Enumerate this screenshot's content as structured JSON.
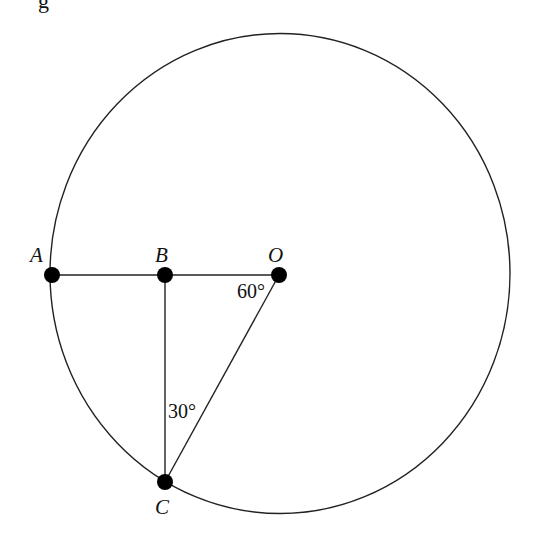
{
  "figure": {
    "clipped_text": "g",
    "stroke_color": "#222222",
    "point_color": "#000000",
    "circle": {
      "cx": 280,
      "cy": 273.5,
      "rx": 230,
      "ry": 240
    },
    "points": {
      "A": {
        "label": "A",
        "x": 52,
        "y": 275
      },
      "B": {
        "label": "B",
        "x": 165,
        "y": 275
      },
      "O": {
        "label": "O",
        "x": 279,
        "y": 275
      },
      "C": {
        "label": "C",
        "x": 165,
        "y": 482
      }
    },
    "angles": {
      "at_O": "60°",
      "at_C": "30°"
    },
    "segments": [
      "AB",
      "BO",
      "BC",
      "OC"
    ]
  }
}
